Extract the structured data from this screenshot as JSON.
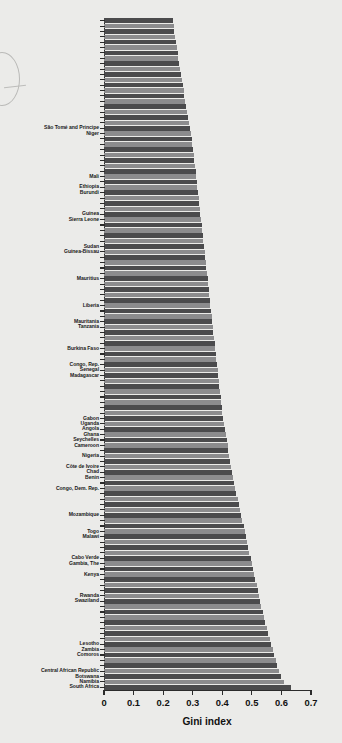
{
  "chart_data": {
    "type": "bar",
    "orientation": "horizontal",
    "title": "",
    "xlabel": "Gini index",
    "ylabel": "",
    "xlim": [
      0,
      0.7
    ],
    "xticks": [
      "0",
      "0.1",
      "0.2",
      "0.3",
      "0.4",
      "0.5",
      "0.6",
      "0.7"
    ],
    "xtick_values": [
      0,
      0.1,
      0.2,
      0.3,
      0.4,
      0.5,
      0.6,
      0.7
    ],
    "grid": false,
    "legend": null,
    "bar_colors": [
      "#4b4b4d",
      "#8c8c8e"
    ],
    "note": "Bars sorted ascending by Gini index; only a subset of countries carry visible y-axis labels.",
    "categories": [
      "",
      "",
      "",
      "",
      "",
      "",
      "",
      "",
      "",
      "",
      "",
      "",
      "",
      "",
      "",
      "",
      "",
      "",
      "",
      "",
      "São Tomé and Principe",
      "Niger",
      "",
      "",
      "",
      "",
      "",
      "",
      "",
      "Mali",
      "",
      "Ethiopia",
      "Burundi",
      "",
      "",
      "",
      "Guinea",
      "Sierra Leone",
      "",
      "",
      "",
      "",
      "Sudan",
      "Guinea-Bissau",
      "",
      "",
      "",
      "",
      "Mauritius",
      "",
      "",
      "",
      "",
      "Liberia",
      "",
      "",
      "Mauritania",
      "Tanzania",
      "",
      "",
      "",
      "Burkina Faso",
      "",
      "",
      "Congo, Rep.",
      "Senegal",
      "Madagascar",
      "",
      "",
      "",
      "",
      "",
      "",
      "",
      "Gabon",
      "Uganda",
      "Angola",
      "Ghana",
      "Seychelles",
      "Cameroon",
      "",
      "Nigeria",
      "",
      "Côte de Ivoire",
      "Chad",
      "Benin",
      "",
      "Congo, Dem. Rep.",
      "",
      "",
      "",
      "",
      "Mozambique",
      "",
      "",
      "Togo",
      "Malawi",
      "",
      "",
      "",
      "Cabo Verde",
      "Gambia, The",
      "",
      "Kenya",
      "",
      "",
      "",
      "Rwanda",
      "Swaziland",
      "",
      "",
      "",
      "",
      "",
      "",
      "",
      "Lesotho",
      "Zambia",
      "Comoros",
      "",
      "",
      "Central African Republic",
      "Botswana",
      "Namibia",
      "South Africa"
    ],
    "values": [
      0.232,
      0.236,
      0.238,
      0.241,
      0.243,
      0.246,
      0.249,
      0.251,
      0.254,
      0.257,
      0.26,
      0.263,
      0.266,
      0.269,
      0.272,
      0.275,
      0.278,
      0.281,
      0.284,
      0.287,
      0.29,
      0.293,
      0.296,
      0.299,
      0.302,
      0.304,
      0.306,
      0.308,
      0.31,
      0.312,
      0.314,
      0.316,
      0.318,
      0.32,
      0.322,
      0.324,
      0.326,
      0.328,
      0.33,
      0.332,
      0.334,
      0.336,
      0.338,
      0.34,
      0.342,
      0.344,
      0.346,
      0.348,
      0.35,
      0.352,
      0.354,
      0.356,
      0.358,
      0.36,
      0.362,
      0.364,
      0.366,
      0.368,
      0.37,
      0.372,
      0.374,
      0.376,
      0.378,
      0.38,
      0.382,
      0.384,
      0.386,
      0.388,
      0.39,
      0.392,
      0.394,
      0.396,
      0.398,
      0.4,
      0.403,
      0.406,
      0.409,
      0.412,
      0.415,
      0.418,
      0.421,
      0.424,
      0.427,
      0.43,
      0.433,
      0.436,
      0.44,
      0.444,
      0.448,
      0.452,
      0.456,
      0.46,
      0.464,
      0.468,
      0.472,
      0.476,
      0.48,
      0.484,
      0.488,
      0.492,
      0.496,
      0.5,
      0.504,
      0.508,
      0.512,
      0.516,
      0.52,
      0.524,
      0.528,
      0.532,
      0.536,
      0.54,
      0.545,
      0.55,
      0.555,
      0.56,
      0.565,
      0.57,
      0.575,
      0.58,
      0.586,
      0.592,
      0.6,
      0.61,
      0.632
    ]
  }
}
